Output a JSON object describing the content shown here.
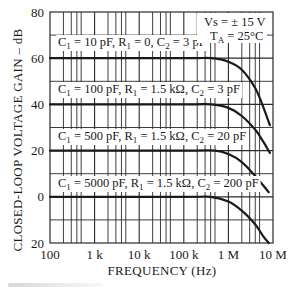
{
  "chart_data": {
    "type": "line",
    "title": "",
    "xlabel": "FREQUENCY (Hz)",
    "ylabel": "CLOSED-LOOP VOLTAGE GAIN – dB",
    "x_scale": "log",
    "xlim": [
      100,
      10000000
    ],
    "ylim": [
      -20,
      80
    ],
    "grid": true,
    "x_ticks": [
      {
        "value": 100,
        "label": "100"
      },
      {
        "value": 1000,
        "label": "1 k"
      },
      {
        "value": 10000,
        "label": "10 k"
      },
      {
        "value": 100000,
        "label": "100 k"
      },
      {
        "value": 1000000,
        "label": "1 M"
      },
      {
        "value": 10000000,
        "label": "10 M"
      }
    ],
    "y_ticks": [
      {
        "value": 80,
        "label": "80"
      },
      {
        "value": 60,
        "label": "60"
      },
      {
        "value": 40,
        "label": "40"
      },
      {
        "value": 20,
        "label": "20"
      },
      {
        "value": 0,
        "label": "0"
      },
      {
        "value": -20,
        "label": "20"
      }
    ],
    "annotations": [
      {
        "text": "Vs = ± 15 V"
      },
      {
        "text": "TA = 25°C"
      }
    ],
    "series": [
      {
        "name": "C1 = 10 pF, R1 = 0, C2 = 3 pF",
        "label_parts": {
          "c1": "10 pF",
          "r1": "0",
          "c2": "3 pF"
        },
        "x": [
          100,
          100000,
          400000,
          1000000,
          2000000,
          4000000,
          6000000,
          8500000
        ],
        "y": [
          60,
          60,
          60,
          58.5,
          55,
          47,
          39,
          31
        ]
      },
      {
        "name": "C1 = 100 pF, R1 = 1.5 kΩ, C2 = 3 pF",
        "label_parts": {
          "c1": "100 pF",
          "r1": "1.5 kΩ",
          "c2": "3 pF"
        },
        "x": [
          100,
          100000,
          400000,
          1000000,
          2000000,
          4000000,
          6000000,
          8500000
        ],
        "y": [
          40,
          40,
          40,
          38.5,
          35,
          29,
          24,
          19
        ]
      },
      {
        "name": "C1 = 500 pF, R1 = 1.5 kΩ, C2 = 20 pF",
        "label_parts": {
          "c1": "500 pF",
          "r1": "1.5 kΩ",
          "c2": "20 pF"
        },
        "x": [
          100,
          100000,
          500000,
          1000000,
          2000000,
          4000000,
          6000000,
          8000000
        ],
        "y": [
          20,
          20,
          20,
          18.5,
          15,
          9,
          5,
          2
        ]
      },
      {
        "name": "C1 = 5000 pF, R1 = 1.5 kΩ, C2 = 200 pF",
        "label_parts": {
          "c1": "5000 pF",
          "r1": "1.5 kΩ",
          "c2": "200 pF"
        },
        "x": [
          100,
          100000,
          400000,
          1000000,
          2000000,
          4000000,
          6000000,
          8000000
        ],
        "y": [
          0,
          0,
          0,
          -2,
          -6,
          -12,
          -17,
          -20
        ]
      }
    ]
  },
  "labels": {
    "vs": "Vs = ± 15 V",
    "ta_prefix": "T",
    "ta_sub": "A",
    "ta_suffix": " = 25°C",
    "curve_labels": [
      {
        "c1": "10 pF",
        "r1": "0",
        "c2": "3 pF"
      },
      {
        "c1": "100 pF",
        "r1": "1.5 kΩ",
        "c2": "3 pF"
      },
      {
        "c1": "500 pF",
        "r1": "1.5 kΩ",
        "c2": "20 pF"
      },
      {
        "c1": "5000 pF",
        "r1": "1.5 kΩ",
        "c2": "200 pF"
      }
    ]
  },
  "colors": {
    "line": "#1a1a1a",
    "grid": "#2a2a2a",
    "background": "#ffffff"
  }
}
